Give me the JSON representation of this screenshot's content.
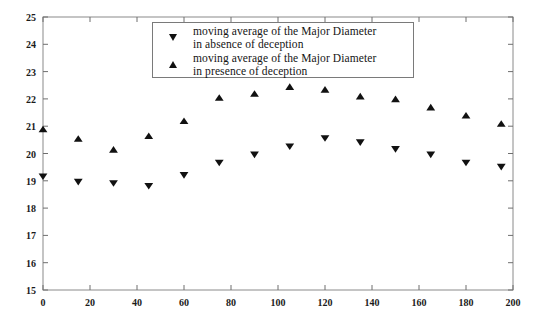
{
  "chart_data": {
    "type": "scatter",
    "title": "",
    "xlabel": "",
    "ylabel": "",
    "xlim": [
      0,
      200
    ],
    "ylim": [
      15,
      25
    ],
    "xticks": [
      0,
      20,
      40,
      60,
      80,
      100,
      120,
      140,
      160,
      180,
      200
    ],
    "yticks": [
      15,
      16,
      17,
      18,
      19,
      20,
      21,
      22,
      23,
      24,
      25
    ],
    "xtick_labels": [
      "0",
      "20",
      "40",
      "60",
      "80",
      "100",
      "120",
      "140",
      "160",
      "180",
      "200"
    ],
    "ytick_labels": [
      "15",
      "16",
      "17",
      "18",
      "19",
      "20",
      "21",
      "22",
      "23",
      "24",
      "25"
    ],
    "grid": false,
    "legend_position": "upper center",
    "x": [
      0,
      15,
      30,
      45,
      60,
      75,
      90,
      105,
      120,
      135,
      150,
      165,
      180,
      195
    ],
    "series": [
      {
        "name": "moving average of the Major Diameter in absence of deception",
        "marker": "triangle-down",
        "color": "#111111",
        "values": [
          19.15,
          18.95,
          18.9,
          18.8,
          19.2,
          19.65,
          19.95,
          20.25,
          20.55,
          20.4,
          20.15,
          19.95,
          19.65,
          19.5
        ]
      },
      {
        "name": "moving average of the Major Diameter in presence of deception",
        "marker": "triangle-up",
        "color": "#111111",
        "values": [
          20.9,
          20.55,
          20.15,
          20.65,
          21.2,
          22.05,
          22.2,
          22.45,
          22.35,
          22.1,
          22.0,
          21.7,
          21.4,
          21.1
        ]
      }
    ]
  },
  "legend": {
    "entries": [
      {
        "marker": "triangle-down-marker",
        "line1": "moving average of the Major Diameter",
        "line2": "in absence of deception"
      },
      {
        "marker": "triangle-up-marker",
        "line1": "moving average of the Major Diameter",
        "line2": "in presence of deception"
      }
    ]
  },
  "axes": {
    "frame_color": "#8a8a8a",
    "tick_color": "#6e6e6e"
  }
}
